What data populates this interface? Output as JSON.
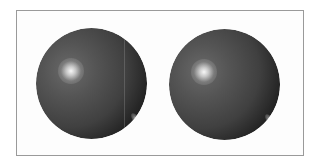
{
  "figure": {
    "frame": {
      "border_color": "#9a9a9a",
      "background": "#fdfdfd"
    },
    "spheres": [
      {
        "id": "left",
        "base_color": "#404040",
        "specular_highlight": "upper-left",
        "rim_highlight": "lower-right",
        "artifact": "faint vertical line"
      },
      {
        "id": "right",
        "base_color": "#404040",
        "specular_highlight": "upper-left",
        "rim_highlight": "lower-right"
      }
    ]
  }
}
